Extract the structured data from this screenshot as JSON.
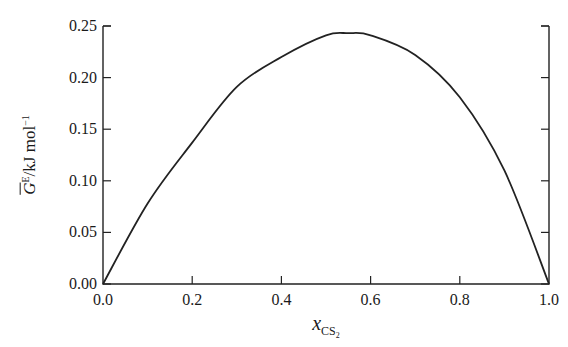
{
  "chart_data": {
    "type": "line",
    "title": "",
    "xlabel": "x_CS2",
    "xlabel_parts": {
      "var": "x",
      "sub": "CS",
      "subsub": "2"
    },
    "ylabel": "Ḡ^E / kJ mol^-1",
    "ylabel_parts": {
      "sym": "G",
      "sup": "E",
      "unit": "/kJ mol",
      "unit_sup": "−1"
    },
    "xlim": [
      0.0,
      1.0
    ],
    "ylim": [
      0.0,
      0.25
    ],
    "xticks": [
      "0.0",
      "0.2",
      "0.4",
      "0.6",
      "0.8",
      "1.0"
    ],
    "yticks": [
      "0.00",
      "0.05",
      "0.10",
      "0.15",
      "0.20",
      "0.25"
    ],
    "grid": false,
    "legend": null,
    "series": [
      {
        "name": "G^E",
        "x": [
          0.0,
          0.1,
          0.2,
          0.3,
          0.4,
          0.5,
          0.55,
          0.6,
          0.7,
          0.8,
          0.9,
          1.0
        ],
        "y": [
          0.0,
          0.078,
          0.137,
          0.191,
          0.22,
          0.241,
          0.243,
          0.241,
          0.222,
          0.181,
          0.11,
          0.0
        ]
      }
    ]
  }
}
